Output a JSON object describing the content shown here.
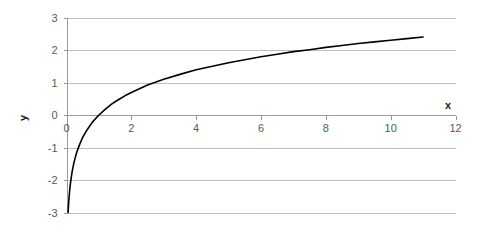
{
  "chart_data": {
    "type": "line",
    "title": "",
    "subtitle": "",
    "xlabel": "x",
    "ylabel": "y",
    "xlim": [
      0,
      12
    ],
    "ylim": [
      -3,
      3
    ],
    "xticks": [
      0,
      2,
      4,
      6,
      8,
      10,
      12
    ],
    "xtick_labels": [
      "0",
      "2",
      "4",
      "6",
      "8",
      "10",
      "12"
    ],
    "yticks": [
      -3,
      -2,
      -1,
      0,
      1,
      2,
      3
    ],
    "ytick_labels": [
      "-3",
      "-2",
      "-1",
      "0",
      "1",
      "2",
      "3"
    ],
    "grid": "horizontal",
    "legend": "none",
    "series": [
      {
        "name": "ln(x)",
        "color": "#000000",
        "x": [
          0.05,
          0.06,
          0.07,
          0.08,
          0.09,
          0.1,
          0.12,
          0.15,
          0.18,
          0.22,
          0.26,
          0.3,
          0.35,
          0.4,
          0.45,
          0.5,
          0.6,
          0.7,
          0.8,
          0.9,
          1.0,
          1.2,
          1.4,
          1.6,
          1.8,
          2.0,
          2.5,
          3.0,
          3.5,
          4.0,
          4.5,
          5.0,
          5.5,
          6.0,
          6.5,
          7.0,
          7.5,
          8.0,
          8.5,
          9.0,
          9.5,
          10.0,
          10.5,
          11.0
        ],
        "y": [
          -3.0,
          -2.81,
          -2.66,
          -2.53,
          -2.41,
          -2.3,
          -2.12,
          -1.9,
          -1.71,
          -1.51,
          -1.35,
          -1.2,
          -1.05,
          -0.92,
          -0.8,
          -0.69,
          -0.51,
          -0.36,
          -0.22,
          -0.11,
          0.0,
          0.18,
          0.34,
          0.47,
          0.59,
          0.69,
          0.92,
          1.1,
          1.25,
          1.39,
          1.5,
          1.61,
          1.7,
          1.79,
          1.87,
          1.95,
          2.01,
          2.08,
          2.14,
          2.2,
          2.25,
          2.3,
          2.35,
          2.4
        ]
      }
    ]
  },
  "axes": {
    "x_title": "x",
    "y_title": "y"
  }
}
